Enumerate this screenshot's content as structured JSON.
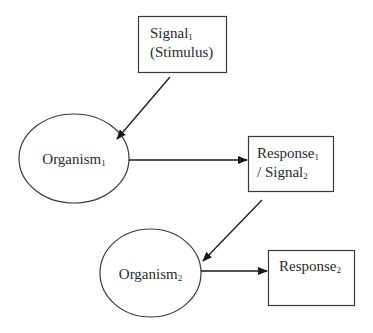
{
  "diagram": {
    "type": "flow",
    "stroke_color": "#2a2a2a",
    "background": "#ffffff",
    "nodes": [
      {
        "id": "signal1",
        "shape": "rectangle",
        "line1": {
          "text": "Signal",
          "sub": "1"
        },
        "line2": {
          "text": "(Stimulus)"
        }
      },
      {
        "id": "organism1",
        "shape": "ellipse",
        "line1": {
          "text": "Organism",
          "sub": "1"
        }
      },
      {
        "id": "response1_signal2",
        "shape": "rectangle",
        "line1": {
          "text": "Response",
          "sub": "1"
        },
        "line2": {
          "text": "/ Signal",
          "sub": "2"
        }
      },
      {
        "id": "organism2",
        "shape": "ellipse",
        "line1": {
          "text": "Organism",
          "sub": "2"
        }
      },
      {
        "id": "response2",
        "shape": "rectangle",
        "line1": {
          "text": "Response",
          "sub": "2"
        }
      }
    ],
    "edges": [
      {
        "from": "signal1",
        "to": "organism1"
      },
      {
        "from": "organism1",
        "to": "response1_signal2"
      },
      {
        "from": "response1_signal2",
        "to": "organism2"
      },
      {
        "from": "organism2",
        "to": "response2"
      }
    ]
  }
}
